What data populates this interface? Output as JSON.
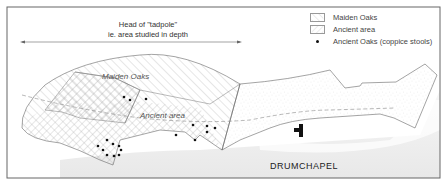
{
  "map": {
    "header": {
      "line1": "Head of \"tadpole\"",
      "line2": "ie. area studied in depth"
    },
    "legend": {
      "items": [
        {
          "label": "Maiden Oaks",
          "pattern": "diagonal-hatch-forward"
        },
        {
          "label": "Ancient area",
          "pattern": "diagonal-hatch-backward"
        },
        {
          "label": "Ancient Oaks (coppice stools)",
          "pattern": "dot"
        }
      ]
    },
    "area_labels": {
      "maiden": "Maiden Oaks",
      "ancient": "Ancient area",
      "town": "DRUMCHAPEL"
    },
    "colors": {
      "outline": "#555555",
      "hatch": "#aaaaaa",
      "stipple": "#bbbbbb",
      "town_shade": "#eeeeee",
      "dot": "#111111",
      "frame": "#666666"
    }
  }
}
